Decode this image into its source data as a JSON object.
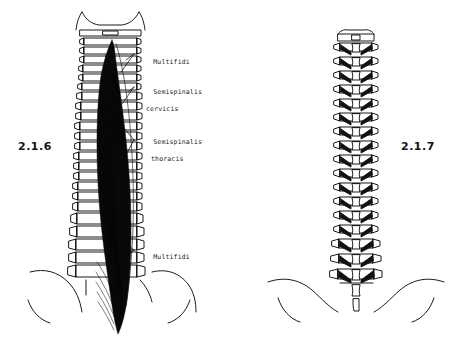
{
  "figure": {
    "background_color": "#ffffff",
    "ink_color": "#000000",
    "caption_color": "#141414"
  },
  "figures": [
    {
      "number": "2.1.6",
      "side": "left",
      "description": "posterior view of vertebral column with deep back musculature shaded"
    },
    {
      "number": "2.1.7",
      "side": "right",
      "description": "posterior view of vertebral column with rotatores muscles"
    }
  ],
  "labels": [
    {
      "id": "multifidi-upper",
      "line1": "Multifidi",
      "line2": ""
    },
    {
      "id": "semispinalis-cervicis",
      "line1": "Semispinalis",
      "line2": "cervicis"
    },
    {
      "id": "semispinalis-thoracis",
      "line1": "Semispinalis",
      "line2": "thoracis"
    },
    {
      "id": "multifidi-lower",
      "line1": "Multifidi",
      "line2": ""
    }
  ]
}
